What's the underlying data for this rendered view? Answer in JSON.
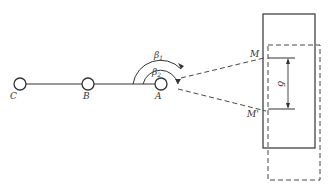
{
  "diagram": {
    "points": [
      {
        "id": "C",
        "label": "C",
        "x": 17,
        "y": 84
      },
      {
        "id": "B",
        "label": "B",
        "x": 88,
        "y": 84
      },
      {
        "id": "A",
        "label": "A",
        "x": 161,
        "y": 84
      }
    ],
    "angles": [
      {
        "id": "beta1",
        "label": "β",
        "subscript": "1"
      },
      {
        "id": "beta2",
        "label": "β",
        "subscript": "2"
      }
    ],
    "target": {
      "top_label": "M",
      "bottom_label": "M'",
      "displacement_label": "δ"
    },
    "colors": {
      "line": "#333333",
      "background": "#ffffff"
    }
  }
}
